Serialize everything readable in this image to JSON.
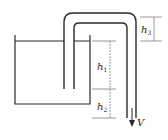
{
  "diagram": {
    "type": "siphon",
    "colors": {
      "stroke": "#2a2a2a",
      "dim": "#555555",
      "background": "#ffffff"
    },
    "labels": {
      "h1": {
        "base": "h",
        "sub": "1"
      },
      "h2": {
        "base": "h",
        "sub": "2"
      },
      "h3": {
        "base": "h",
        "sub": "3"
      },
      "velocity": "V"
    }
  }
}
